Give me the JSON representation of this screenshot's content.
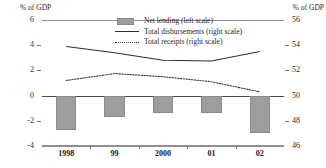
{
  "axes": {
    "left_unit_caption": "% of GDP",
    "right_unit_caption": "% of GDP",
    "left_ticks": [
      "6",
      "4",
      "2",
      "0",
      "-2",
      "-4"
    ],
    "right_ticks": [
      "56",
      "54",
      "52",
      "50",
      "48",
      "46"
    ],
    "x_labels": [
      "1998",
      "99",
      "2000",
      "01",
      "02"
    ]
  },
  "legend": {
    "items": [
      {
        "label": "Net lending (left scale)",
        "key": "bar-swatch"
      },
      {
        "label": "Total disbursements (right scale)",
        "key": "solid-line"
      },
      {
        "label": "Total receipts (right scale)",
        "key": "dotted-line"
      }
    ]
  },
  "colors": {
    "bar_fill": "#9d9d9d",
    "bar_stroke": "#8a8a8a",
    "disbursements_line": "#2f2f2f",
    "receipts_line": "#3a3a3a",
    "gridline": "#b9b9b9",
    "zero_line": "#4a4a4a"
  },
  "chart_data": {
    "type": "bar",
    "title": "",
    "subtitle": "",
    "xlabel": "",
    "ylabel": "% of GDP",
    "y2label": "% of GDP",
    "categories": [
      "1998",
      "99",
      "2000",
      "01",
      "02"
    ],
    "ylim": [
      -4,
      6
    ],
    "y2lim": [
      46,
      56
    ],
    "ytick_step": 2,
    "y2tick_step": 2,
    "grid": true,
    "legend_position": "top-center",
    "series": [
      {
        "name": "Net lending (left scale)",
        "type": "bar",
        "axis": "left",
        "values": [
          -2.75,
          -1.7,
          -1.35,
          -1.4,
          -3.0
        ]
      },
      {
        "name": "Total disbursements (right scale)",
        "type": "line",
        "style": "solid",
        "axis": "right",
        "values": [
          53.9,
          53.4,
          52.8,
          52.75,
          53.5
        ]
      },
      {
        "name": "Total receipts (right scale)",
        "type": "line",
        "style": "dotted",
        "axis": "right",
        "values": [
          51.2,
          51.75,
          51.5,
          51.1,
          50.3
        ]
      }
    ]
  }
}
